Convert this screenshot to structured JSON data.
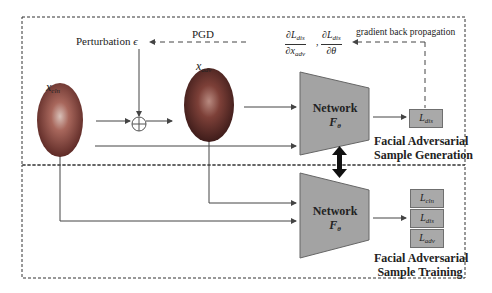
{
  "diagram": {
    "labels": {
      "pgd": "PGD",
      "perturbation": "Perturbation",
      "epsilon": "ϵ",
      "x_cln_main": "x",
      "x_cln_sub": "cln",
      "x_adv_main": "x",
      "x_adv_sub": "adv",
      "gradient": "gradient back propagation",
      "grad_num1": "∂L",
      "grad_num1_sub": "dis",
      "grad_den1": "∂x",
      "grad_den1_sub": "adv",
      "grad_num2": "∂L",
      "grad_num2_sub": "dis",
      "grad_den2": "∂θ",
      "comma": ","
    },
    "network_top": {
      "title": "Network",
      "sub_main": "F",
      "sub_sub": "θ"
    },
    "network_bottom": {
      "title": "Network",
      "sub_main": "F",
      "sub_sub": "θ"
    },
    "loss_top": {
      "main": "L",
      "sub": "dis"
    },
    "losses_bottom": [
      {
        "main": "L",
        "sub": "cln"
      },
      {
        "main": "L",
        "sub": "dis"
      },
      {
        "main": "L",
        "sub": "adv"
      }
    ],
    "section_generation": {
      "line1": "Facial Adversarial",
      "line2": "Sample Generation"
    },
    "section_training": {
      "line1": "Facial Adversarial",
      "line2": "Sample Training"
    }
  },
  "colors": {
    "network_fill": "#a3a3a3",
    "loss_fill": "#a9a9a9",
    "line": "#444444",
    "face_dark": "#7a3a34",
    "face_light": "#c9a59a"
  }
}
